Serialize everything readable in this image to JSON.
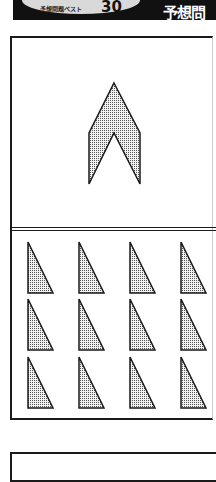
{
  "header": {
    "pill_label": "予想問題ベスト",
    "pill_number": "30",
    "right_title": "予想問"
  },
  "figure_top": {
    "shape": "chevron-arrow",
    "points": [
      [
        114,
        83
      ],
      [
        140,
        133
      ],
      [
        140,
        184
      ],
      [
        114,
        133
      ],
      [
        89,
        184
      ],
      [
        89,
        133
      ]
    ],
    "fill": "dotted-gray"
  },
  "figure_bottom": {
    "shape": "right-triangle",
    "rows": 3,
    "cols": 4,
    "col_x": [
      28,
      79,
      130,
      181
    ],
    "row_y": [
      242,
      299,
      357
    ],
    "width": 25,
    "height": 51,
    "fill": "dotted-gray"
  },
  "colors": {
    "ink": "#1a1a1a",
    "pill": "#d9d9d9",
    "band": "#111111"
  }
}
